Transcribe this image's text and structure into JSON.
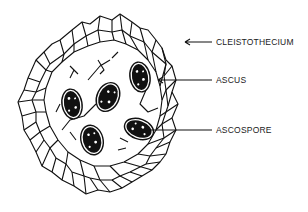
{
  "diagram": {
    "labels": [
      {
        "id": "cleistothecium",
        "text": "CLEISTOTHECIUM"
      },
      {
        "id": "ascus",
        "text": "ASCUS"
      },
      {
        "id": "ascospore",
        "text": "ASCOSPORE"
      }
    ],
    "colors": {
      "ink": "#111111",
      "background": "#ffffff"
    }
  }
}
